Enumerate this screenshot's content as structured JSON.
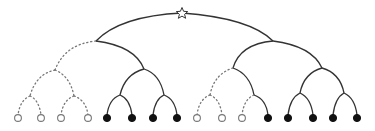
{
  "diagram": {
    "type": "binary-tree",
    "root": {
      "symbol": "star",
      "x": 182,
      "y": 13
    },
    "edge_styles": {
      "solid": "#333333",
      "dotted": "#777777"
    },
    "leaf_styles": {
      "open": "hollow circle",
      "filled": "black circle"
    },
    "leaves": [
      {
        "x": 18,
        "type": "open"
      },
      {
        "x": 41,
        "type": "open"
      },
      {
        "x": 61,
        "type": "open"
      },
      {
        "x": 88,
        "type": "open"
      },
      {
        "x": 107,
        "type": "filled"
      },
      {
        "x": 132,
        "type": "filled"
      },
      {
        "x": 153,
        "type": "filled"
      },
      {
        "x": 177,
        "type": "filled"
      },
      {
        "x": 197,
        "type": "open"
      },
      {
        "x": 222,
        "type": "open"
      },
      {
        "x": 242,
        "type": "open"
      },
      {
        "x": 268,
        "type": "filled"
      },
      {
        "x": 288,
        "type": "filled"
      },
      {
        "x": 313,
        "type": "filled"
      },
      {
        "x": 333,
        "type": "filled"
      },
      {
        "x": 357,
        "type": "filled"
      }
    ],
    "leaf_count": 16,
    "open_leaf_count": 7,
    "filled_leaf_count": 9
  }
}
